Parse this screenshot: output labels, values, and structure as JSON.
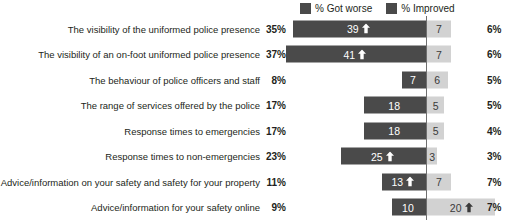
{
  "legend": {
    "items": [
      {
        "label": "% Got worse",
        "color": "#4a4a4a"
      },
      {
        "label": "% Improved",
        "color": "#4a4a4a"
      }
    ]
  },
  "colors": {
    "got_worse_bar": "#4a4a4a",
    "improved_bar": "#d2d2d2",
    "center_line": "#6f6f6f",
    "text": "#231f20"
  },
  "chart_data": {
    "type": "bar",
    "title": "",
    "xlabel": "",
    "ylabel": "",
    "orientation": "horizontal",
    "layout": "diverging",
    "grid": false,
    "legend_position": "top-right",
    "center_value": 0,
    "categories": [
      "The visibility of the uniformed police presence",
      "The visibility of an on-foot uniformed police presence",
      "The behaviour of police officers and staff",
      "The range of services offered by the police",
      "Response times to emergencies",
      "Response times to non-emergencies",
      "Advice/information on your safety and safety for your property",
      "Advice/information for your safety online"
    ],
    "series": [
      {
        "name": "% Got worse",
        "values": [
          39,
          41,
          7,
          18,
          18,
          25,
          13,
          10
        ],
        "direction": "left",
        "color": "#4a4a4a"
      },
      {
        "name": "% Improved",
        "values": [
          7,
          7,
          6,
          5,
          5,
          3,
          7,
          20
        ],
        "direction": "right",
        "color": "#d2d2d2"
      }
    ],
    "left_axis_labels": [
      "35%",
      "37%",
      "8%",
      "17%",
      "17%",
      "23%",
      "11%",
      "9%"
    ],
    "right_axis_labels": [
      "6%",
      "6%",
      "5%",
      "5%",
      "4%",
      "3%",
      "7%",
      "7%"
    ],
    "arrow_markers": {
      "got_worse": [
        true,
        true,
        false,
        false,
        false,
        true,
        true,
        false
      ],
      "improved": [
        false,
        false,
        false,
        false,
        false,
        false,
        false,
        true
      ]
    }
  },
  "rows": [
    {
      "label": "The visibility of the uniformed police presence",
      "pct_left": "35%",
      "pct_right": "6%",
      "worse_value": "39",
      "improved_value": "7",
      "worse_arrow": true,
      "improved_arrow": false
    },
    {
      "label": "The visibility of an on-foot uniformed police presence",
      "pct_left": "37%",
      "pct_right": "6%",
      "worse_value": "41",
      "improved_value": "7",
      "worse_arrow": true,
      "improved_arrow": false
    },
    {
      "label": "The behaviour of police officers and staff",
      "pct_left": "8%",
      "pct_right": "5%",
      "worse_value": "7",
      "improved_value": "6",
      "worse_arrow": false,
      "improved_arrow": false
    },
    {
      "label": "The range of services offered by the police",
      "pct_left": "17%",
      "pct_right": "5%",
      "worse_value": "18",
      "improved_value": "5",
      "worse_arrow": false,
      "improved_arrow": false
    },
    {
      "label": "Response times to emergencies",
      "pct_left": "17%",
      "pct_right": "4%",
      "worse_value": "18",
      "improved_value": "5",
      "worse_arrow": false,
      "improved_arrow": false
    },
    {
      "label": "Response times to non-emergencies",
      "pct_left": "23%",
      "pct_right": "3%",
      "worse_value": "25",
      "improved_value": "3",
      "worse_arrow": true,
      "improved_arrow": false
    },
    {
      "label": "Advice/information on your safety and safety for your property",
      "pct_left": "11%",
      "pct_right": "7%",
      "worse_value": "13",
      "improved_value": "7",
      "worse_arrow": true,
      "improved_arrow": false
    },
    {
      "label": "Advice/information for your safety online",
      "pct_left": "9%",
      "pct_right": "7%",
      "worse_value": "10",
      "improved_value": "20",
      "worse_arrow": false,
      "improved_arrow": true
    }
  ]
}
